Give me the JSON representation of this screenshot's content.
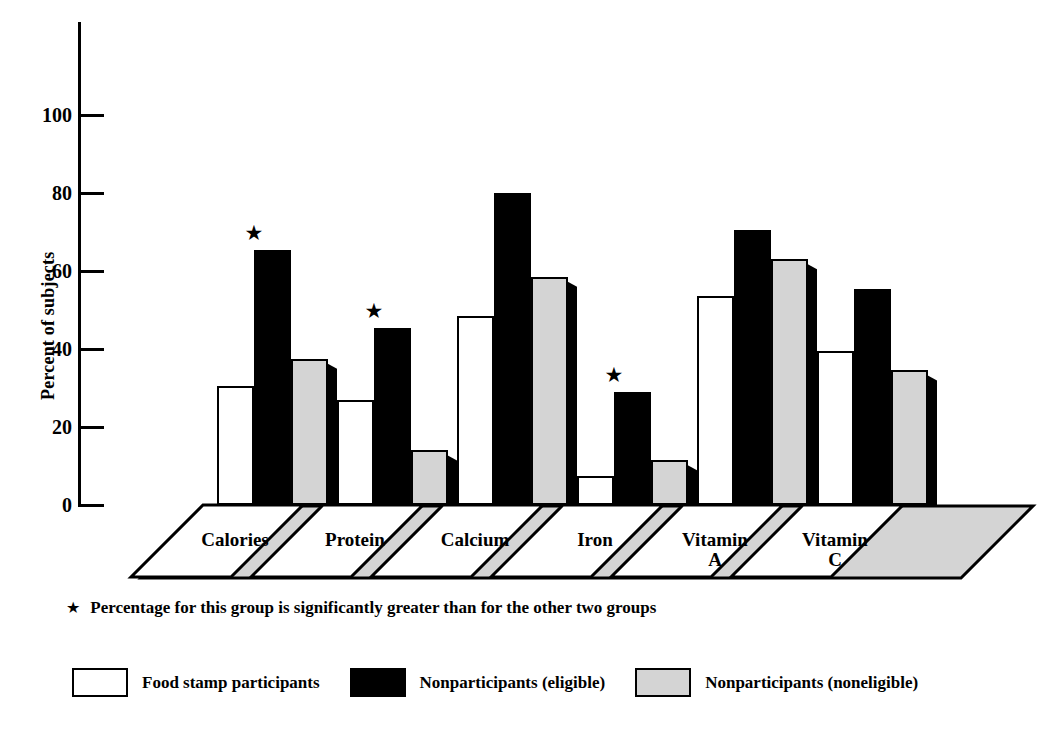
{
  "axis": {
    "ylabel": "Percent of subjects",
    "yticks": [
      "0",
      "20",
      "40",
      "60",
      "80",
      "100"
    ]
  },
  "footnote": {
    "marker": "★",
    "text": "Percentage for this group is significantly greater than for the other two groups"
  },
  "legend": {
    "items": [
      {
        "label": "Food stamp participants",
        "swatch": "white",
        "color": "#ffffff"
      },
      {
        "label": "Nonparticipants (eligible)",
        "swatch": "black",
        "color": "#000000"
      },
      {
        "label": "Nonparticipants (noneligible)",
        "swatch": "gray",
        "color": "#d4d4d4"
      }
    ]
  },
  "chart_data": {
    "type": "bar",
    "title": "",
    "xlabel": "",
    "ylabel": "Percent of subjects",
    "ylim": [
      0,
      100
    ],
    "grid": false,
    "legend_position": "bottom",
    "categories": [
      "Calories",
      "Protein",
      "Calcium",
      "Iron",
      "Vitamin\nA",
      "Vitamin\nC"
    ],
    "series": [
      {
        "name": "Food stamp participants",
        "color": "#ffffff",
        "values": [
          30.5,
          27.0,
          48.5,
          7.5,
          53.5,
          39.5
        ]
      },
      {
        "name": "Nonparticipants (eligible)",
        "color": "#000000",
        "values": [
          65.5,
          45.5,
          80.0,
          29.0,
          70.5,
          55.5
        ]
      },
      {
        "name": "Nonparticipants (noneligible)",
        "color": "#d4d4d4",
        "values": [
          37.5,
          14.0,
          58.5,
          11.5,
          63.0,
          34.5
        ]
      }
    ],
    "annotations": [
      {
        "category": "Calories",
        "series": "Nonparticipants (eligible)",
        "marker": "★"
      },
      {
        "category": "Protein",
        "series": "Nonparticipants (eligible)",
        "marker": "★"
      },
      {
        "category": "Iron",
        "series": "Nonparticipants (eligible)",
        "marker": "★"
      }
    ]
  }
}
